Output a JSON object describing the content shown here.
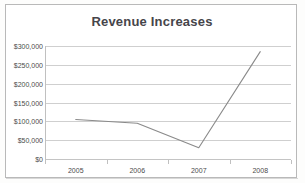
{
  "chart_data": {
    "type": "line",
    "title": "Revenue Increases",
    "xlabel": "",
    "ylabel": "",
    "categories": [
      "2005",
      "2006",
      "2007",
      "2008"
    ],
    "series": [
      {
        "name": "Revenue",
        "values": [
          105000,
          95000,
          30000,
          285000
        ]
      }
    ],
    "ylim": [
      0,
      300000
    ],
    "ytick_values": [
      0,
      50000,
      100000,
      150000,
      200000,
      250000,
      300000
    ],
    "ytick_labels": [
      "$0",
      "$50,000",
      "$100,000",
      "$150,000",
      "$200,000",
      "$250,000",
      "$300,000"
    ],
    "grid": true,
    "legend": false,
    "legend_position": "none",
    "colors": {
      "line": "#8a8a8a",
      "gridline": "#cfcfcf",
      "title_text": "#46454a",
      "tick_text": "#4b4b4b",
      "plot_background": "#ffffff",
      "frame_border": "#b9b9b9"
    }
  }
}
